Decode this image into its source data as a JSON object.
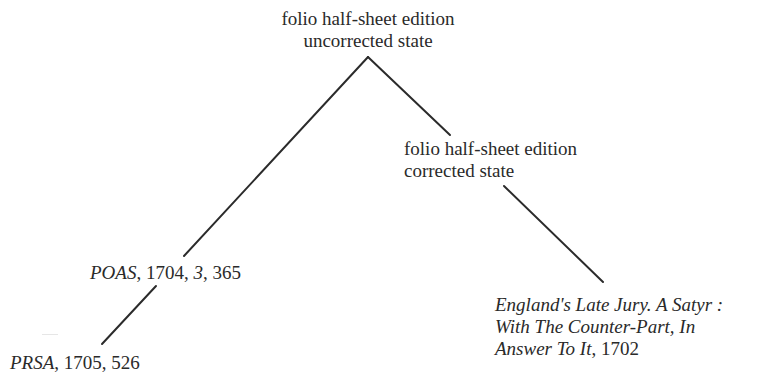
{
  "diagram": {
    "type": "stemma-tree",
    "nodes": {
      "root": {
        "line1": "folio half-sheet edition",
        "line2": "uncorrected state"
      },
      "corrected": {
        "line1": "folio half-sheet edition",
        "line2": "corrected state"
      },
      "poas": {
        "title": "POAS",
        "rest1": ", 1704, ",
        "vol": "3",
        "rest2": ", 365"
      },
      "prsa": {
        "title": "PRSA",
        "rest": ", 1705, 526"
      },
      "england": {
        "line1": "England's Late Jury. A Satyr :",
        "line2": "With The Counter-Part, In",
        "line3_title": "Answer To It",
        "line3_rest": ", 1702"
      }
    },
    "edges": [
      {
        "from": "root",
        "to": "poas"
      },
      {
        "from": "root",
        "to": "corrected"
      },
      {
        "from": "corrected",
        "to": "england"
      },
      {
        "from": "poas",
        "to": "prsa"
      }
    ],
    "line_color": "#2b2b2b",
    "text_color": "#2a2a2a"
  }
}
